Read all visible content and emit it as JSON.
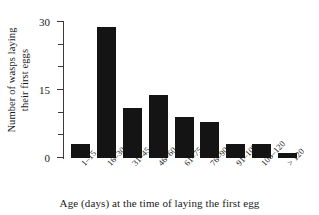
{
  "chart_data": {
    "type": "bar",
    "title": "",
    "xlabel": "Age (days) at the time of laying the first egg",
    "ylabel_line1": "Number of wasps laying",
    "ylabel_line2": "their first eggs",
    "ylabel": "Number of wasps laying their first eggs",
    "categories": [
      "1–15",
      "16–30",
      "31–45",
      "46–60",
      "61–75",
      "76–90",
      "91–105",
      "106–120",
      "> 120"
    ],
    "values": [
      3,
      29,
      11,
      14,
      9,
      8,
      3,
      3,
      1
    ],
    "ylim": [
      0,
      30
    ],
    "xlim_note": "categorical",
    "ytick_labels": [
      "0",
      "15",
      "30"
    ],
    "ytick_values": [
      0,
      15,
      30
    ],
    "yminor_tick_values": [
      5,
      10,
      20,
      25
    ],
    "grid": false,
    "legend": "none",
    "bar_color": "#141414",
    "axis_color": "#3b3b3b",
    "background_color": "#ffffff"
  }
}
